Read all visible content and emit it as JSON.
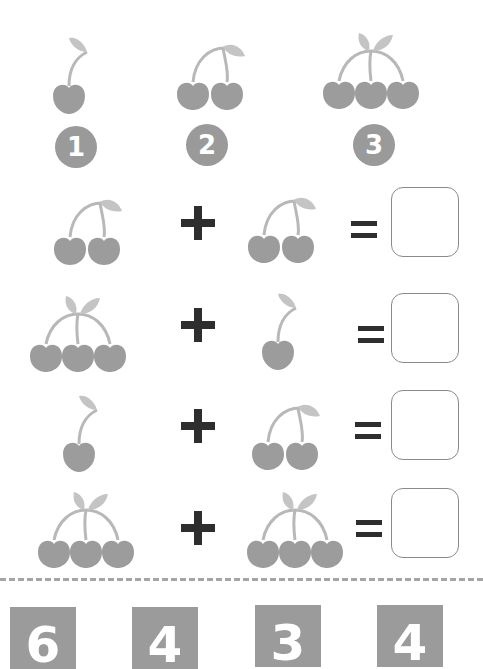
{
  "colors": {
    "cherry": "#9c9c9c",
    "stem": "#b8b8b8",
    "leaf": "#c4c4c4",
    "badge": "#9a9a9a",
    "operator": "#2e2e2e",
    "box_border": "#8a8a8a"
  },
  "legend": [
    {
      "count": 1,
      "label": "1"
    },
    {
      "count": 2,
      "label": "2"
    },
    {
      "count": 3,
      "label": "3"
    }
  ],
  "problems": [
    {
      "left": 2,
      "operator": "+",
      "right": 2,
      "equals": "=",
      "answer": ""
    },
    {
      "left": 3,
      "operator": "+",
      "right": 1,
      "equals": "=",
      "answer": ""
    },
    {
      "left": 1,
      "operator": "+",
      "right": 2,
      "equals": "=",
      "answer": ""
    },
    {
      "left": 3,
      "operator": "+",
      "right": 3,
      "equals": "=",
      "answer": ""
    }
  ],
  "answer_choices": [
    "6",
    "4",
    "3",
    "4"
  ]
}
